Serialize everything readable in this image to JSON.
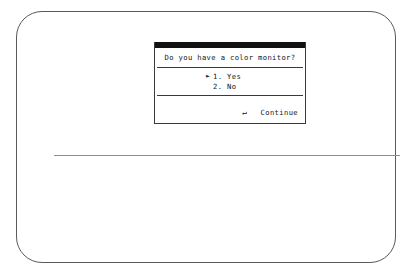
{
  "screen": {
    "bezel_color": "#5a5a5a",
    "background_color": "#ffffff",
    "divider_color": "#8d8d8d"
  },
  "dialog": {
    "titlebar_color": "#111111",
    "border_color": "#3a3a3a",
    "question": "Do you have a color monitor?",
    "options": [
      {
        "pointer": "►",
        "selected": true,
        "number": "1.",
        "label": "Yes"
      },
      {
        "pointer": "►",
        "selected": false,
        "number": "2.",
        "label": "No"
      }
    ],
    "footer": {
      "key_icon": "↵",
      "key_icon_name": "enter-key-icon",
      "action_label": "Continue"
    }
  }
}
